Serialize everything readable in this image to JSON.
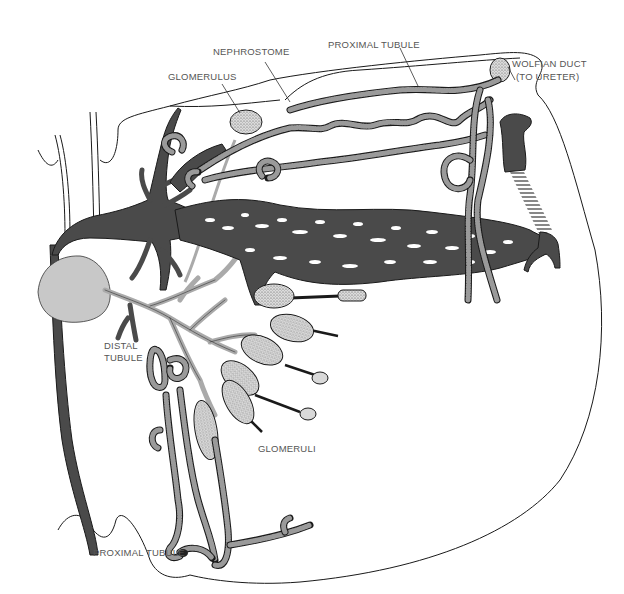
{
  "figure": {
    "colors": {
      "background": "#ffffff",
      "outline": "#1a1a1a",
      "dark_vessel": "#4a4a4a",
      "light_vessel": "#c8c8c8",
      "label_text": "#555555"
    }
  },
  "labels": {
    "nephrostome": "NEPHROSTOME",
    "proximal_tubule_top": "PROXIMAL TUBULE",
    "wolfian_duct_line1": "WOLFIAN DUCT",
    "wolfian_duct_line2": "(TO URETER)",
    "glomerulus": "GLOMERULUS",
    "distal_tubule_line1": "DISTAL",
    "distal_tubule_line2": "TUBULE",
    "glomeruli": "GLOMERULI",
    "proximal_tubule_bottom": "PROXIMAL TUBULE"
  }
}
